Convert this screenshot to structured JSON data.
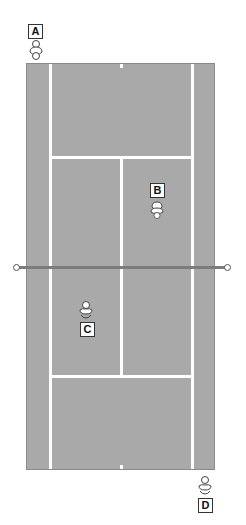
{
  "diagram": {
    "type": "tennis-court-positions",
    "colors": {
      "court": "#a9a9a9",
      "lines": "#ffffff",
      "net": "#7c7c7c",
      "label_border": "#333333"
    },
    "players": [
      {
        "id": "A",
        "label": "A",
        "position": "behind baseline, top-left"
      },
      {
        "id": "B",
        "label": "B",
        "position": "top half, right service box near net"
      },
      {
        "id": "C",
        "label": "C",
        "position": "bottom half, left service box near net"
      },
      {
        "id": "D",
        "label": "D",
        "position": "behind baseline, bottom-right"
      }
    ]
  }
}
